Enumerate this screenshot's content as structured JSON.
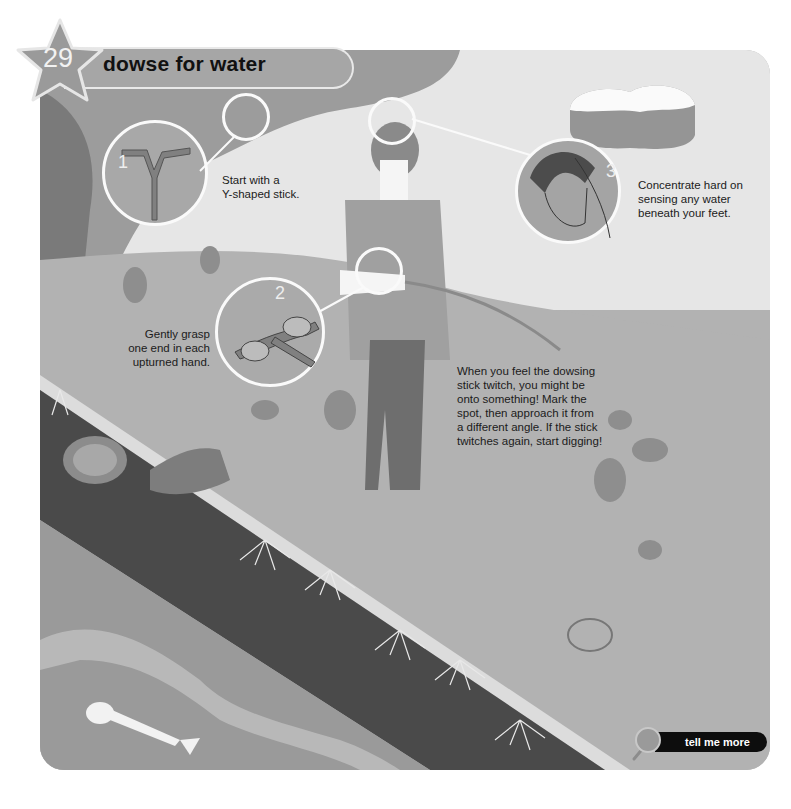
{
  "header": {
    "number": "29",
    "title": "dowse for water"
  },
  "steps": [
    {
      "number": "1",
      "text": "Start with a Y-shaped stick.",
      "lines": [
        "Start with a",
        "Y-shaped stick."
      ]
    },
    {
      "number": "2",
      "text": "Gently grasp one end in each upturned hand.",
      "lines": [
        "Gently grasp",
        "one end in each",
        "upturned hand."
      ]
    },
    {
      "number": "3",
      "text": "Concentrate hard on sensing any water beneath your feet.",
      "lines": [
        "Concentrate hard on",
        "sensing any water",
        "beneath your feet."
      ]
    }
  ],
  "main_text": {
    "lines": [
      "When you feel the dowsing",
      "stick twitch, you might be",
      "onto something! Mark the",
      "spot, then approach it from",
      "a different angle. If the stick",
      "twitches again, start digging!"
    ]
  },
  "footer": {
    "more_button_label": "tell me more",
    "icon": "magnifier-icon"
  },
  "colors": {
    "star": "#9a9a9a",
    "header_bar": "#a6a6a6",
    "grass": "#b2b2b2",
    "soil_dark": "#4a4a4a",
    "button": "#0d0d0d"
  }
}
